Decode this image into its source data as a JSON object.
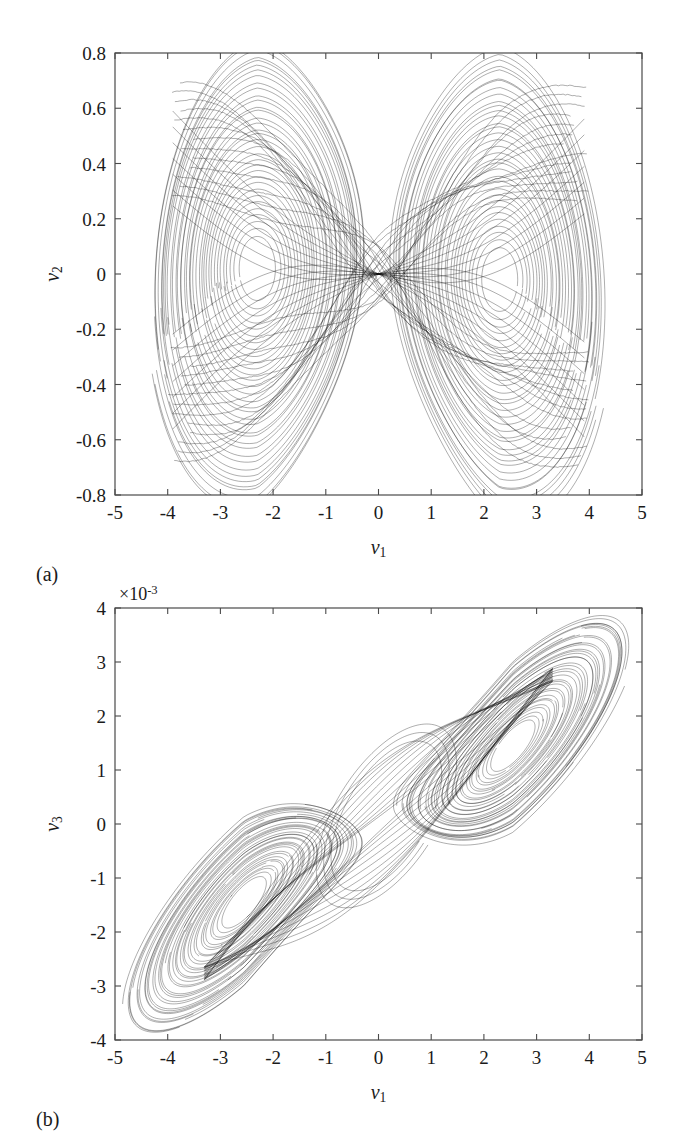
{
  "figure": {
    "panels": [
      {
        "id": "a",
        "label": "(a)",
        "xlabel_base": "ν",
        "xlabel_sub": "1",
        "ylabel_base": "ν",
        "ylabel_sub": "2",
        "exponent_text": "",
        "xticks": [
          "-5",
          "-4",
          "-3",
          "-2",
          "-1",
          "0",
          "1",
          "2",
          "3",
          "4",
          "5"
        ],
        "yticks": [
          "0.8",
          "0.6",
          "0.4",
          "0.2",
          "0",
          "-0.2",
          "-0.4",
          "-0.6",
          "-0.8"
        ]
      },
      {
        "id": "b",
        "label": "(b)",
        "xlabel_base": "ν",
        "xlabel_sub": "1",
        "ylabel_base": "ν",
        "ylabel_sub": "3",
        "exponent_text": "×10",
        "exponent_sup": "-3",
        "xticks": [
          "-5",
          "-4",
          "-3",
          "-2",
          "-1",
          "0",
          "1",
          "2",
          "3",
          "4",
          "5"
        ],
        "yticks": [
          "4",
          "3",
          "2",
          "1",
          "0",
          "-1",
          "-2",
          "-3",
          "-4"
        ]
      }
    ]
  },
  "chart_data": [
    {
      "type": "line",
      "id": "a",
      "title": "",
      "xlabel": "ν1",
      "ylabel": "ν2",
      "xlim": [
        -5,
        5
      ],
      "ylim": [
        -0.8,
        0.8
      ],
      "xticks": [
        -5,
        -4,
        -3,
        -2,
        -1,
        0,
        1,
        2,
        3,
        4,
        5
      ],
      "yticks": [
        -0.8,
        -0.6,
        -0.4,
        -0.2,
        0,
        0.2,
        0.4,
        0.6,
        0.8
      ],
      "grid": false,
      "legend": "none",
      "y_scale_exponent": 0,
      "description": "Double-scroll chaotic attractor phase portrait, nu2 versus nu1. Two dense spiral lobes joined by a criss-crossing transition band through the origin.",
      "series": [
        {
          "name": "attractor-trajectory",
          "color": "#000000",
          "linewidth": 0.35,
          "attractor": {
            "model": "chua-double-scroll",
            "left_focus": [
              -2.3,
              0.02
            ],
            "right_focus": [
              2.3,
              -0.02
            ],
            "lobe_x_extent": [
              -4.0,
              4.2
            ],
            "lobe_y_extent": [
              -0.78,
              0.79
            ],
            "eye_left": {
              "cx": -2.35,
              "cy": 0.03,
              "rx": 0.33,
              "ry": 0.12
            },
            "eye_right": {
              "cx": 2.4,
              "cy": -0.05,
              "rx": 0.33,
              "ry": 0.12
            },
            "n_turns": 34,
            "n_switch": 26
          }
        }
      ]
    },
    {
      "type": "line",
      "id": "b",
      "title": "",
      "xlabel": "ν1",
      "ylabel": "ν3",
      "xlim": [
        -5,
        5
      ],
      "ylim": [
        -0.004,
        0.004
      ],
      "xticks": [
        -5,
        -4,
        -3,
        -2,
        -1,
        0,
        1,
        2,
        3,
        4,
        5
      ],
      "yticks": [
        -0.004,
        -0.003,
        -0.002,
        -0.001,
        0,
        0.001,
        0.002,
        0.003,
        0.004
      ],
      "grid": false,
      "legend": "none",
      "y_scale_exponent": -3,
      "description": "Double-scroll chaotic attractor phase portrait, nu3 versus nu1. Two dense tilted elliptical lobes arranged along a rising diagonal, connected by a thin sheet near the origin.",
      "series": [
        {
          "name": "attractor-trajectory",
          "color": "#000000",
          "linewidth": 0.35,
          "attractor": {
            "model": "chua-double-scroll-tilted",
            "left_focus": [
              -2.55,
              -0.00145
            ],
            "right_focus": [
              2.55,
              0.00145
            ],
            "lobe_x_extent": [
              -4.05,
              4.1
            ],
            "lobe_y_extent": [
              -0.0036,
              0.0036
            ],
            "tilt_slope": 0.00082,
            "eye_left": {
              "cx": -2.55,
              "cy": -0.00145,
              "rx": 0.42,
              "ry": 0.00032
            },
            "eye_right": {
              "cx": 2.55,
              "cy": 0.00148,
              "rx": 0.42,
              "ry": 0.00032
            },
            "n_turns": 34,
            "n_switch": 22
          }
        }
      ]
    }
  ]
}
